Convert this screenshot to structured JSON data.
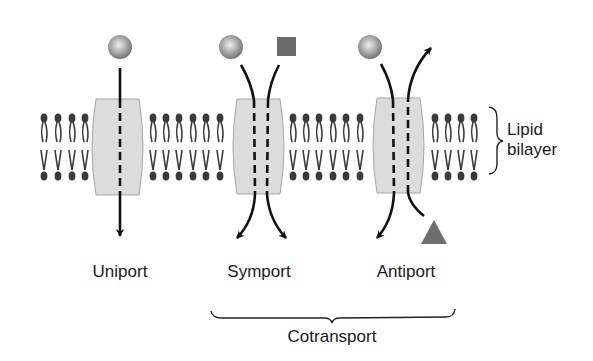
{
  "diagram": {
    "transporters": [
      {
        "id": "uniport",
        "label": "Uniport",
        "substrates": [
          "sphere"
        ],
        "direction": "in"
      },
      {
        "id": "symport",
        "label": "Symport",
        "substrates": [
          "sphere",
          "square"
        ],
        "direction": "same"
      },
      {
        "id": "antiport",
        "label": "Antiport",
        "substrates": [
          "sphere",
          "triangle"
        ],
        "direction": "opposite"
      }
    ],
    "membrane_label_line1": "Lipid",
    "membrane_label_line2": "bilayer",
    "group_label": "Cotransport",
    "colors": {
      "protein_fill": "#dcdcdc",
      "protein_stroke": "#a8a8a8",
      "lipid": "#3a3a3a",
      "arrow": "#111111",
      "square": "#6b6b6b",
      "triangle": "#6e6e6e",
      "sphere_light": "#d8d8d8",
      "sphere_dark": "#7a7a7a"
    }
  }
}
